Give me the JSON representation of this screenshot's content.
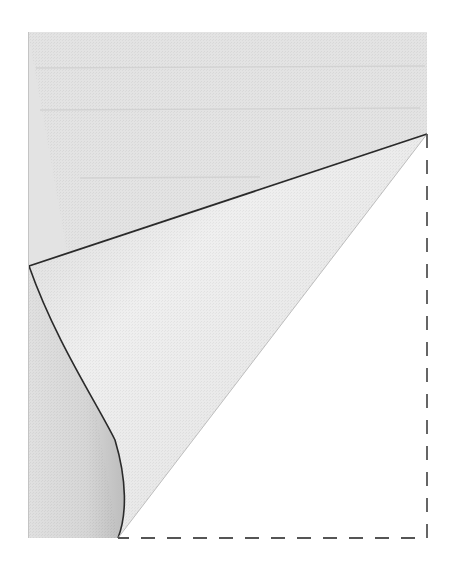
{
  "figure": {
    "type": "folded-page-corner-illustration",
    "colors": {
      "background": "#ffffff",
      "page": "#e4e4e4",
      "page_shadow": "#cfcfcf",
      "flap_light": "#f1f1f1",
      "flap_mid": "#dadada",
      "fold_line": "#2a2a2a",
      "dashed_outline": "#555555"
    },
    "page": {
      "left": 28,
      "top": 32,
      "right": 427,
      "bottom": 538
    },
    "fold_line": {
      "from": [
        29,
        266
      ],
      "to": [
        427,
        134
      ]
    },
    "flap_tip": [
      118,
      538
    ],
    "dash_pattern": "14 12"
  }
}
